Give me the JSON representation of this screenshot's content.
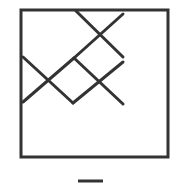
{
  "figure": {
    "stroke_color": "#333333",
    "background": "#ffffff",
    "frame": {
      "x": 21,
      "y": 10,
      "width": 147,
      "height": 147
    },
    "segments": [
      {
        "x1": 76,
        "y1": 11,
        "x2": 123,
        "y2": 57
      },
      {
        "x1": 123,
        "y1": 14,
        "x2": 74,
        "y2": 58
      },
      {
        "x1": 74,
        "y1": 58,
        "x2": 23,
        "y2": 102
      },
      {
        "x1": 23,
        "y1": 57,
        "x2": 73,
        "y2": 103
      },
      {
        "x1": 73,
        "y1": 103,
        "x2": 123,
        "y2": 62
      },
      {
        "x1": 74,
        "y1": 58,
        "x2": 123,
        "y2": 104
      }
    ],
    "partial_bottom_mark": {
      "x1": 78,
      "y1": 181,
      "x2": 103,
      "y2": 181
    }
  }
}
